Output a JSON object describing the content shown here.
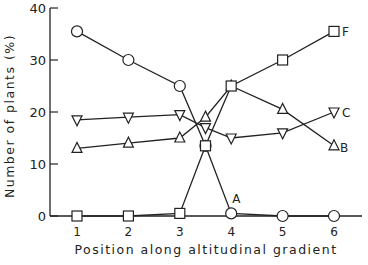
{
  "chart_data": {
    "type": "line",
    "title": "",
    "xlabel": "Position along altitudinal gradient",
    "ylabel": "Number of plants (%)",
    "xlim": [
      0.5,
      6.5
    ],
    "ylim": [
      0,
      40
    ],
    "x_ticks": [
      "1",
      "2",
      "3",
      "4",
      "5",
      "6"
    ],
    "y_ticks": [
      "0",
      "10",
      "20",
      "30",
      "40"
    ],
    "grid": false,
    "legend": "inline labels at line ends",
    "series": [
      {
        "name": "A",
        "marker": "circle",
        "x": [
          1,
          2,
          3,
          3.5,
          4,
          5,
          6
        ],
        "values": [
          35.5,
          30,
          25,
          13.5,
          0.5,
          0,
          0
        ]
      },
      {
        "name": "B",
        "marker": "triangle-up",
        "x": [
          1,
          2,
          3,
          3.5,
          4,
          5,
          6
        ],
        "values": [
          13,
          14,
          15,
          19,
          25,
          20.5,
          13.5
        ]
      },
      {
        "name": "C",
        "marker": "triangle-down",
        "x": [
          1,
          2,
          3,
          3.5,
          4,
          5,
          6
        ],
        "values": [
          18.5,
          19,
          19.5,
          17,
          15,
          16,
          20
        ]
      },
      {
        "name": "F",
        "marker": "square",
        "x": [
          1,
          2,
          3,
          3.5,
          4,
          5,
          6
        ],
        "values": [
          0,
          0,
          0.5,
          13.5,
          25,
          30,
          35.5
        ]
      }
    ]
  }
}
